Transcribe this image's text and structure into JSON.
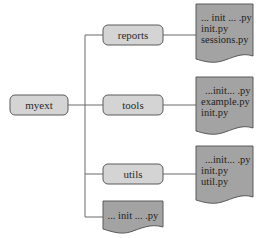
{
  "diagram": {
    "type": "directory-tree",
    "colors": {
      "folder_fill": "#d4d4d4",
      "file_fill": "#a3a3a3",
      "stroke": "#5a5a5a",
      "line": "#6a6a6a",
      "text": "#2a2a2a"
    },
    "root": {
      "label": "myext"
    },
    "children": [
      {
        "label": "reports",
        "files": [
          "... init ... .py",
          "init.py",
          "sessions.py"
        ]
      },
      {
        "label": "tools",
        "files": [
          "...init... .py",
          "example.py",
          "init.py"
        ]
      },
      {
        "label": "utils",
        "files": [
          "...init... .py",
          "init.py",
          "util.py"
        ]
      }
    ],
    "root_file": {
      "label": "... init ... .py"
    }
  }
}
